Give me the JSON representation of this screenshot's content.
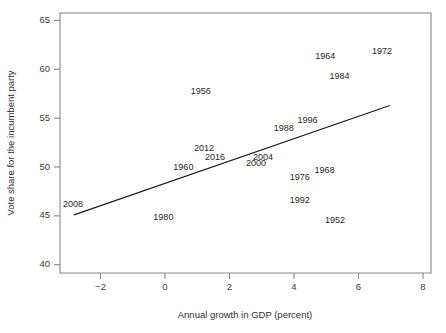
{
  "chart_data": {
    "type": "scatter",
    "title": "",
    "subtitle": "",
    "xlabel": "Annual growth in GDP (percent)",
    "ylabel": "Vote share for the incumbent party",
    "xlim": [
      -3.0,
      8.4
    ],
    "ylim": [
      39.2,
      65.6
    ],
    "xticks": [
      -2,
      0,
      2,
      4,
      6,
      8
    ],
    "xtick_labels": [
      "−2",
      "0",
      "2",
      "4",
      "6",
      "8"
    ],
    "yticks": [
      40,
      45,
      50,
      55,
      60,
      65
    ],
    "ytick_labels": [
      "40",
      "45",
      "50",
      "55",
      "60",
      "65"
    ],
    "grid": false,
    "legend": null,
    "marker_style": "text-label-only",
    "points": [
      {
        "label": "1952",
        "x": 5.27,
        "y": 44.5
      },
      {
        "label": "1956",
        "x": 1.11,
        "y": 57.7
      },
      {
        "label": "1960",
        "x": 0.57,
        "y": 49.9
      },
      {
        "label": "1964",
        "x": 4.97,
        "y": 61.3
      },
      {
        "label": "1968",
        "x": 4.95,
        "y": 49.6
      },
      {
        "label": "1972",
        "x": 6.73,
        "y": 61.8
      },
      {
        "label": "1976",
        "x": 4.18,
        "y": 48.9
      },
      {
        "label": "1980",
        "x": -0.05,
        "y": 44.8
      },
      {
        "label": "1984",
        "x": 5.41,
        "y": 59.2
      },
      {
        "label": "1988",
        "x": 3.68,
        "y": 53.9
      },
      {
        "label": "1992",
        "x": 4.18,
        "y": 46.6
      },
      {
        "label": "1996",
        "x": 4.42,
        "y": 54.7
      },
      {
        "label": "2000",
        "x": 2.82,
        "y": 50.3
      },
      {
        "label": "2004",
        "x": 3.04,
        "y": 51.0
      },
      {
        "label": "2008",
        "x": -2.85,
        "y": 46.2
      },
      {
        "label": "2012",
        "x": 1.21,
        "y": 51.9
      },
      {
        "label": "2016",
        "x": 1.55,
        "y": 51.0
      }
    ],
    "fit_line": {
      "name": "linear regression fit",
      "x_start": -2.82,
      "y_start": 45.1,
      "x_end": 6.97,
      "y_end": 56.3
    }
  }
}
